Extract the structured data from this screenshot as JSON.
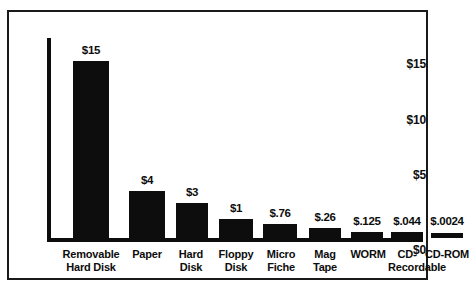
{
  "chart_data": {
    "type": "bar",
    "title": "",
    "subtitle": "",
    "xlabel": "",
    "ylabel": "",
    "categories": [
      "Removable Hard Disk",
      "Paper",
      "Hard Disk",
      "Floppy Disk",
      "Micro Fiche",
      "Mag Tape",
      "WORM",
      "CD-Recordable",
      "CD-ROM"
    ],
    "category_lines": [
      [
        "Removable",
        "Hard Disk"
      ],
      [
        "Paper",
        ""
      ],
      [
        "Hard",
        "Disk"
      ],
      [
        "Floppy",
        "Disk"
      ],
      [
        "Micro",
        "Fiche"
      ],
      [
        "Mag",
        "Tape"
      ],
      [
        "WORM",
        ""
      ],
      [
        "CD-",
        "Recordable"
      ],
      [
        "CD-ROM",
        ""
      ]
    ],
    "values": [
      15,
      4,
      3,
      1,
      0.76,
      0.26,
      0.125,
      0.044,
      0.0024
    ],
    "value_labels": [
      "$15",
      "$4",
      "$3",
      "$1",
      "$.76",
      "$.26",
      "$.125",
      "$.044",
      "$.0024"
    ],
    "ylim": [
      0,
      17
    ],
    "yticks": [
      0,
      5,
      10,
      15
    ],
    "ytick_labels": [
      "$0",
      "$5",
      "$10",
      "$15"
    ],
    "grid": false,
    "legend": false,
    "bar_color": "#0d0d0d",
    "axis_color": "#0d0d0d",
    "background_color": "#ffffff",
    "border_color": "#1a1a1a"
  },
  "yticks": {
    "t15": "$15",
    "t10": "$10",
    "t5": "$5",
    "t0": "$0"
  },
  "values": {
    "v0": "$15",
    "v1": "$4",
    "v2": "$3",
    "v3": "$1",
    "v4": "$.76",
    "v5": "$.26",
    "v6": "$.125",
    "v7": "$.044",
    "v8": "$.0024"
  },
  "categories": {
    "c0a": "Removable",
    "c0b": "Hard Disk",
    "c1a": "Paper",
    "c1b": "",
    "c2a": "Hard",
    "c2b": "Disk",
    "c3a": "Floppy",
    "c3b": "Disk",
    "c4a": "Micro",
    "c4b": "Fiche",
    "c5a": "Mag",
    "c5b": "Tape",
    "c6a": "WORM",
    "c6b": "",
    "c7a": "CD-",
    "c7b": "Recordable",
    "c8a": "CD-ROM",
    "c8b": ""
  }
}
